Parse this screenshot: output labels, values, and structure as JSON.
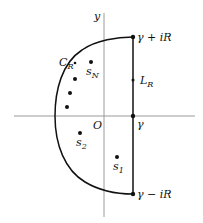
{
  "diagram": {
    "type": "contour-diagram",
    "axes": {
      "y_label": "y",
      "origin_label": "O"
    },
    "contour": {
      "arc_label": "C",
      "arc_label_sub": "R",
      "line_label": "L",
      "line_label_sub": "R",
      "top_point_label": "γ + iR",
      "bottom_point_label": "γ − iR",
      "axis_point_label": "γ"
    },
    "points": {
      "s1": {
        "base": "s",
        "sub": "1"
      },
      "s2": {
        "base": "s",
        "sub": "2"
      },
      "sN": {
        "base": "s",
        "sub": "N"
      }
    },
    "colors": {
      "axis": "#999999",
      "contour": "#111111",
      "point": "#111111"
    }
  }
}
